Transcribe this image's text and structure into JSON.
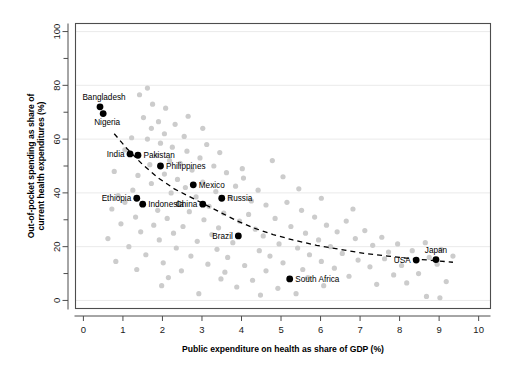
{
  "chart_data": {
    "type": "scatter",
    "title": "",
    "xlabel": "Public expenditure on health as share of GDP (%)",
    "ylabel": "Out-of-pocket spending as share of current health expenditures (%)",
    "xlim": [
      -0.2,
      10.3
    ],
    "ylim": [
      -3,
      103
    ],
    "xticks": [
      0,
      1,
      2,
      3,
      4,
      5,
      6,
      7,
      8,
      9,
      10
    ],
    "xticklabels": [
      "0",
      "1",
      "2",
      "3",
      "4",
      "5",
      "6",
      "7",
      "8",
      "9",
      "10"
    ],
    "yticks": [
      0,
      20,
      40,
      60,
      80,
      100
    ],
    "yticklabels": [
      "0",
      "20",
      "40",
      "60",
      "80",
      "100"
    ],
    "yminorticks": [
      10,
      30,
      50,
      70,
      90
    ],
    "grid": "horizontal-major",
    "legend": "none",
    "series": [
      {
        "name": "Labeled countries",
        "color": "#000000",
        "marker": "circle",
        "points": [
          {
            "label": "Bangladesh",
            "x": 0.42,
            "y": 72.0,
            "label_pos": "above-left"
          },
          {
            "label": "Nigeria",
            "x": 0.5,
            "y": 69.5,
            "label_pos": "below-left"
          },
          {
            "label": "India",
            "x": 1.18,
            "y": 54.5,
            "label_pos": "left"
          },
          {
            "label": "Pakistan",
            "x": 1.38,
            "y": 54.0,
            "label_pos": "right"
          },
          {
            "label": "Philippines",
            "x": 1.95,
            "y": 50.0,
            "label_pos": "right"
          },
          {
            "label": "Mexico",
            "x": 2.78,
            "y": 43.0,
            "label_pos": "right"
          },
          {
            "label": "Ethiopia",
            "x": 1.35,
            "y": 38.0,
            "label_pos": "left"
          },
          {
            "label": "Russia",
            "x": 3.5,
            "y": 38.0,
            "label_pos": "right"
          },
          {
            "label": "Indonesia",
            "x": 1.5,
            "y": 35.8,
            "label_pos": "right"
          },
          {
            "label": "China",
            "x": 3.02,
            "y": 35.8,
            "label_pos": "left"
          },
          {
            "label": "Brazil",
            "x": 3.92,
            "y": 24.0,
            "label_pos": "left"
          },
          {
            "label": "USA",
            "x": 8.42,
            "y": 15.0,
            "label_pos": "left"
          },
          {
            "label": "Japan",
            "x": 8.92,
            "y": 15.2,
            "label_pos": "above"
          },
          {
            "label": "South Africa",
            "x": 5.22,
            "y": 8.0,
            "label_pos": "right"
          }
        ]
      },
      {
        "name": "Other countries",
        "color": "#cccccc",
        "marker": "circle",
        "points": [
          {
            "x": 1.62,
            "y": 79.0
          },
          {
            "x": 1.42,
            "y": 76.5
          },
          {
            "x": 1.75,
            "y": 73.0
          },
          {
            "x": 2.08,
            "y": 71.5
          },
          {
            "x": 1.52,
            "y": 68.0
          },
          {
            "x": 1.9,
            "y": 66.5
          },
          {
            "x": 2.32,
            "y": 65.5
          },
          {
            "x": 1.72,
            "y": 64.0
          },
          {
            "x": 2.05,
            "y": 62.0
          },
          {
            "x": 2.55,
            "y": 61.0
          },
          {
            "x": 1.62,
            "y": 60.0
          },
          {
            "x": 1.95,
            "y": 58.5
          },
          {
            "x": 2.25,
            "y": 57.0
          },
          {
            "x": 3.12,
            "y": 58.0
          },
          {
            "x": 2.62,
            "y": 55.5
          },
          {
            "x": 1.85,
            "y": 54.0
          },
          {
            "x": 2.95,
            "y": 53.0
          },
          {
            "x": 3.45,
            "y": 55.0
          },
          {
            "x": 2.18,
            "y": 52.0
          },
          {
            "x": 2.45,
            "y": 51.0
          },
          {
            "x": 1.68,
            "y": 50.5
          },
          {
            "x": 3.3,
            "y": 50.0
          },
          {
            "x": 2.75,
            "y": 48.5
          },
          {
            "x": 2.05,
            "y": 47.0
          },
          {
            "x": 1.38,
            "y": 46.5
          },
          {
            "x": 3.62,
            "y": 47.5
          },
          {
            "x": 2.38,
            "y": 45.0
          },
          {
            "x": 3.02,
            "y": 44.0
          },
          {
            "x": 1.72,
            "y": 43.5
          },
          {
            "x": 4.05,
            "y": 45.5
          },
          {
            "x": 2.58,
            "y": 42.0
          },
          {
            "x": 3.85,
            "y": 42.5
          },
          {
            "x": 1.25,
            "y": 41.0
          },
          {
            "x": 2.22,
            "y": 40.0
          },
          {
            "x": 3.35,
            "y": 40.5
          },
          {
            "x": 4.42,
            "y": 41.0
          },
          {
            "x": 0.88,
            "y": 39.0
          },
          {
            "x": 2.85,
            "y": 38.5
          },
          {
            "x": 3.72,
            "y": 38.0
          },
          {
            "x": 4.25,
            "y": 37.0
          },
          {
            "x": 1.05,
            "y": 36.5
          },
          {
            "x": 2.42,
            "y": 36.0
          },
          {
            "x": 3.18,
            "y": 35.0
          },
          {
            "x": 4.62,
            "y": 35.5
          },
          {
            "x": 5.15,
            "y": 36.5
          },
          {
            "x": 0.72,
            "y": 34.0
          },
          {
            "x": 1.88,
            "y": 33.5
          },
          {
            "x": 2.68,
            "y": 33.0
          },
          {
            "x": 3.55,
            "y": 32.5
          },
          {
            "x": 4.18,
            "y": 32.0
          },
          {
            "x": 5.52,
            "y": 33.5
          },
          {
            "x": 1.32,
            "y": 31.0
          },
          {
            "x": 2.12,
            "y": 30.5
          },
          {
            "x": 3.05,
            "y": 30.0
          },
          {
            "x": 3.95,
            "y": 29.5
          },
          {
            "x": 4.85,
            "y": 30.5
          },
          {
            "x": 5.85,
            "y": 31.0
          },
          {
            "x": 0.95,
            "y": 28.5
          },
          {
            "x": 1.78,
            "y": 28.0
          },
          {
            "x": 2.52,
            "y": 27.5
          },
          {
            "x": 3.42,
            "y": 27.0
          },
          {
            "x": 4.35,
            "y": 26.5
          },
          {
            "x": 5.25,
            "y": 27.5
          },
          {
            "x": 6.15,
            "y": 28.0
          },
          {
            "x": 6.65,
            "y": 29.5
          },
          {
            "x": 1.45,
            "y": 25.5
          },
          {
            "x": 2.28,
            "y": 25.0
          },
          {
            "x": 3.25,
            "y": 24.5
          },
          {
            "x": 4.55,
            "y": 24.0
          },
          {
            "x": 5.62,
            "y": 25.0
          },
          {
            "x": 6.42,
            "y": 25.5
          },
          {
            "x": 7.12,
            "y": 26.0
          },
          {
            "x": 0.62,
            "y": 23.0
          },
          {
            "x": 1.92,
            "y": 22.5
          },
          {
            "x": 2.88,
            "y": 22.0
          },
          {
            "x": 3.78,
            "y": 21.5
          },
          {
            "x": 4.95,
            "y": 21.0
          },
          {
            "x": 5.95,
            "y": 22.5
          },
          {
            "x": 6.88,
            "y": 23.0
          },
          {
            "x": 7.55,
            "y": 23.5
          },
          {
            "x": 1.15,
            "y": 20.0
          },
          {
            "x": 2.35,
            "y": 19.5
          },
          {
            "x": 3.38,
            "y": 19.0
          },
          {
            "x": 4.45,
            "y": 18.5
          },
          {
            "x": 5.42,
            "y": 19.5
          },
          {
            "x": 6.25,
            "y": 20.0
          },
          {
            "x": 7.32,
            "y": 20.5
          },
          {
            "x": 7.95,
            "y": 21.0
          },
          {
            "x": 8.65,
            "y": 21.5
          },
          {
            "x": 1.58,
            "y": 17.0
          },
          {
            "x": 2.72,
            "y": 16.5
          },
          {
            "x": 3.65,
            "y": 16.0
          },
          {
            "x": 4.72,
            "y": 16.5
          },
          {
            "x": 5.72,
            "y": 17.0
          },
          {
            "x": 6.55,
            "y": 17.5
          },
          {
            "x": 7.72,
            "y": 18.0
          },
          {
            "x": 8.32,
            "y": 18.5
          },
          {
            "x": 9.05,
            "y": 19.0
          },
          {
            "x": 0.82,
            "y": 14.5
          },
          {
            "x": 2.02,
            "y": 14.0
          },
          {
            "x": 3.15,
            "y": 13.5
          },
          {
            "x": 4.08,
            "y": 13.0
          },
          {
            "x": 5.05,
            "y": 14.0
          },
          {
            "x": 6.02,
            "y": 14.5
          },
          {
            "x": 6.95,
            "y": 15.0
          },
          {
            "x": 7.62,
            "y": 15.5
          },
          {
            "x": 8.75,
            "y": 16.0
          },
          {
            "x": 9.35,
            "y": 16.5
          },
          {
            "x": 1.35,
            "y": 11.5
          },
          {
            "x": 2.48,
            "y": 11.0
          },
          {
            "x": 3.58,
            "y": 10.5
          },
          {
            "x": 4.62,
            "y": 11.0
          },
          {
            "x": 5.55,
            "y": 11.5
          },
          {
            "x": 6.35,
            "y": 12.0
          },
          {
            "x": 7.25,
            "y": 12.5
          },
          {
            "x": 8.05,
            "y": 13.0
          },
          {
            "x": 8.95,
            "y": 13.5
          },
          {
            "x": 2.15,
            "y": 8.5
          },
          {
            "x": 3.48,
            "y": 8.0
          },
          {
            "x": 4.28,
            "y": 7.5
          },
          {
            "x": 5.68,
            "y": 8.5
          },
          {
            "x": 6.72,
            "y": 9.0
          },
          {
            "x": 7.85,
            "y": 9.5
          },
          {
            "x": 8.48,
            "y": 10.0
          },
          {
            "x": 1.98,
            "y": 5.5
          },
          {
            "x": 3.88,
            "y": 5.0
          },
          {
            "x": 4.92,
            "y": 4.5
          },
          {
            "x": 6.08,
            "y": 5.5
          },
          {
            "x": 7.42,
            "y": 6.0
          },
          {
            "x": 8.18,
            "y": 6.5
          },
          {
            "x": 9.18,
            "y": 7.0
          },
          {
            "x": 2.92,
            "y": 2.5
          },
          {
            "x": 4.48,
            "y": 2.0
          },
          {
            "x": 5.38,
            "y": 2.5
          },
          {
            "x": 8.68,
            "y": 1.5
          },
          {
            "x": 9.02,
            "y": 1.0
          },
          {
            "x": 4.02,
            "y": 49.0
          },
          {
            "x": 5.05,
            "y": 46.0
          },
          {
            "x": 4.78,
            "y": 52.0
          },
          {
            "x": 5.45,
            "y": 41.5
          },
          {
            "x": 6.02,
            "y": 38.0
          },
          {
            "x": 6.82,
            "y": 34.0
          },
          {
            "x": 1.05,
            "y": 56.0
          },
          {
            "x": 0.78,
            "y": 48.0
          },
          {
            "x": 1.22,
            "y": 60.5
          },
          {
            "x": 2.65,
            "y": 68.5
          },
          {
            "x": 3.02,
            "y": 64.0
          }
        ]
      }
    ],
    "trend_line": {
      "style": "dashed",
      "color": "#000000",
      "points": [
        {
          "x": 0.78,
          "y": 62.0
        },
        {
          "x": 1.1,
          "y": 56.5
        },
        {
          "x": 1.5,
          "y": 50.5
        },
        {
          "x": 1.9,
          "y": 45.5
        },
        {
          "x": 2.3,
          "y": 41.5
        },
        {
          "x": 2.7,
          "y": 38.5
        },
        {
          "x": 3.1,
          "y": 35.5
        },
        {
          "x": 3.5,
          "y": 32.5
        },
        {
          "x": 3.9,
          "y": 29.5
        },
        {
          "x": 4.3,
          "y": 27.0
        },
        {
          "x": 4.8,
          "y": 24.5
        },
        {
          "x": 5.3,
          "y": 22.5
        },
        {
          "x": 5.9,
          "y": 20.5
        },
        {
          "x": 6.5,
          "y": 19.0
        },
        {
          "x": 7.1,
          "y": 17.5
        },
        {
          "x": 7.7,
          "y": 16.5
        },
        {
          "x": 8.3,
          "y": 15.5
        },
        {
          "x": 8.9,
          "y": 14.8
        },
        {
          "x": 9.35,
          "y": 14.2
        }
      ]
    }
  }
}
